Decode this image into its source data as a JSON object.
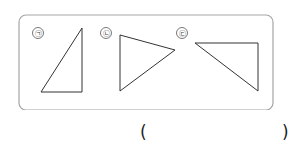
{
  "figures": {
    "labels": [
      "㉠",
      "㉡",
      "㉢"
    ],
    "stroke_color": "#333333",
    "frame_color": "#9a9a9a"
  },
  "answer": {
    "open": "(",
    "close": ")",
    "value": ""
  }
}
